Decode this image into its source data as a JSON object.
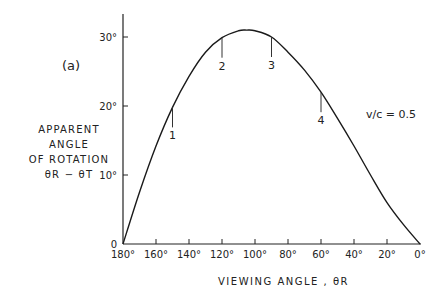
{
  "panel_label": "(a)",
  "y_axis_label_lines": [
    "APPARENT",
    "ANGLE",
    "OF ROTATION",
    "θR − θT"
  ],
  "x_axis_label": "VIEWING ANGLE , θR",
  "parameter_label": "v/c = 0.5",
  "chart_data": {
    "type": "line",
    "title": "",
    "xlabel": "VIEWING ANGLE, θR",
    "ylabel": "APPARENT ANGLE OF ROTATION θR − θT",
    "x_reversed": true,
    "xlim": [
      180,
      0
    ],
    "ylim": [
      0,
      33
    ],
    "grid": false,
    "x_ticks": [
      "180°",
      "160°",
      "140°",
      "120°",
      "100°",
      "80°",
      "60°",
      "40°",
      "20°",
      "0°"
    ],
    "y_ticks": [
      "0",
      "10°",
      "20°",
      "30°"
    ],
    "series": [
      {
        "name": "v/c = 0.5",
        "x": [
          180,
          170,
          160,
          150,
          140,
          130,
          120,
          110,
          105,
          100,
          90,
          80,
          70,
          60,
          50,
          40,
          30,
          20,
          10,
          0
        ],
        "y": [
          0,
          7.5,
          14.2,
          19.8,
          24.3,
          27.8,
          29.9,
          30.9,
          31.0,
          30.9,
          30.0,
          27.8,
          25.2,
          22.0,
          18.2,
          14.2,
          10.0,
          6.0,
          2.8,
          0
        ]
      }
    ],
    "annotations": [
      {
        "label": "1",
        "x": 150,
        "y": 19.8
      },
      {
        "label": "2",
        "x": 120,
        "y": 29.9
      },
      {
        "label": "3",
        "x": 90,
        "y": 30.0
      },
      {
        "label": "4",
        "x": 60,
        "y": 22.0
      }
    ],
    "legend": {
      "text": "v/c = 0.5",
      "position": "right, mid-height"
    }
  }
}
